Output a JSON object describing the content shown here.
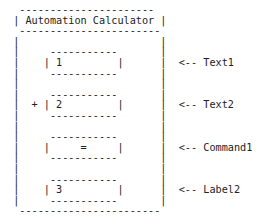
{
  "diagram": {
    "title": "Automation Calculator",
    "lines": [
      "  ---------------------- ",
      " | Automation Calculator |",
      "  -----------------------",
      " |                       |",
      " |     -----------       |",
      " |    | 1         |      |  <-- Text1",
      " |     -----------       |",
      " |                       |",
      " |     -----------       |",
      " |  + | 2         |      |  <-- Text2",
      " |     -----------       |",
      " |                       |",
      " |     -----------       |",
      " |    |     =     |      |  <-- Command1",
      " |     -----------       |",
      " |                       |",
      " |     -----------       |",
      " |    | 3         |      |  <-- Label2",
      " |     -----------       |",
      "  -----------------------"
    ],
    "controls": [
      {
        "name": "Text1",
        "value": "1"
      },
      {
        "name": "Text2",
        "value": "2",
        "operator": "+"
      },
      {
        "name": "Command1",
        "value": "="
      },
      {
        "name": "Label2",
        "value": "3"
      }
    ]
  }
}
